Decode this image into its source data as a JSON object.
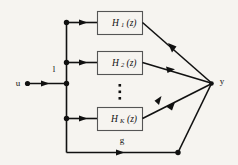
{
  "diagram": {
    "background_color": "#f6f4f0",
    "line_color": "#111111",
    "box_border_color": "#555555",
    "input": {
      "label": "u",
      "branch_label": "l"
    },
    "output": {
      "label": "y"
    },
    "feedthrough": {
      "label": "g"
    },
    "blocks": [
      {
        "name": "H",
        "subscript": "1",
        "arg": "(z)",
        "full": "H_1(z)"
      },
      {
        "name": "H",
        "subscript": "2",
        "arg": "(z)",
        "full": "H_2(z)"
      },
      {
        "name": "H",
        "subscript": "K",
        "arg": "(z)",
        "full": "H_K(z)"
      }
    ],
    "ellipsis": "vertical-ellipsis"
  }
}
